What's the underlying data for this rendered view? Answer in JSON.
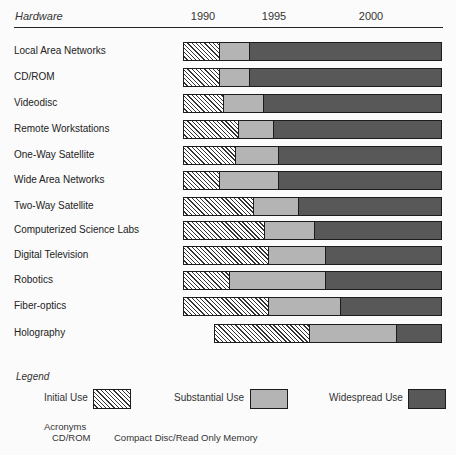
{
  "chart_data": {
    "type": "bar",
    "subtype": "stacked-horizontal-timeline",
    "title": "",
    "xlabel": "",
    "ylabel": "Hardware",
    "x_ticks": [
      "1990",
      "1995",
      "2000"
    ],
    "legend_position": "bottom",
    "grid": false,
    "series_names": [
      "Initial Use",
      "Substantial Use",
      "Widespread Use"
    ],
    "categories": [
      "Local Area Networks",
      "CD/ROM",
      "Videodisc",
      "Remote Workstations",
      "One-Way Satellite",
      "Wide Area Networks",
      "Two-Way Satellite",
      "Computerized Science Labs",
      "Digital Television",
      "Robotics",
      "Fiber-optics",
      "Holography"
    ],
    "rows": [
      {
        "label": "Local Area Networks",
        "px": [
          183,
          219,
          249,
          442
        ],
        "years": {
          "initial_start": 1988.6,
          "substantial_start": 1991.1,
          "widespread_start": 1993.2,
          "end": 2003.6
        }
      },
      {
        "label": "CD/ROM",
        "px": [
          183,
          219,
          249,
          442
        ],
        "years": {
          "initial_start": 1988.6,
          "substantial_start": 1991.1,
          "widespread_start": 1993.2,
          "end": 2003.6
        }
      },
      {
        "label": "Videodisc",
        "px": [
          183,
          223,
          263,
          442
        ],
        "years": {
          "initial_start": 1988.6,
          "substantial_start": 1991.4,
          "widespread_start": 1994.2,
          "end": 2003.6
        }
      },
      {
        "label": "Remote Workstations",
        "px": [
          183,
          238,
          273,
          442
        ],
        "years": {
          "initial_start": 1988.6,
          "substantial_start": 1992.5,
          "widespread_start": 1994.9,
          "end": 2003.6
        }
      },
      {
        "label": "One-Way Satellite",
        "px": [
          183,
          235,
          278,
          442
        ],
        "years": {
          "initial_start": 1988.6,
          "substantial_start": 1992.3,
          "widespread_start": 1995.2,
          "end": 2003.6
        }
      },
      {
        "label": "Wide Area Networks",
        "px": [
          183,
          219,
          278,
          442
        ],
        "years": {
          "initial_start": 1988.6,
          "substantial_start": 1991.1,
          "widespread_start": 1995.2,
          "end": 2003.6
        }
      },
      {
        "label": "Two-Way Satellite",
        "px": [
          183,
          253,
          298,
          442
        ],
        "years": {
          "initial_start": 1988.6,
          "substantial_start": 1993.5,
          "widespread_start": 1996.2,
          "end": 2003.6
        }
      },
      {
        "label": "Computerized Science Labs",
        "px": [
          183,
          264,
          314,
          442
        ],
        "years": {
          "initial_start": 1988.6,
          "substantial_start": 1994.3,
          "widespread_start": 1997.1,
          "end": 2003.6
        }
      },
      {
        "label": "Digital Television",
        "px": [
          183,
          268,
          325,
          442
        ],
        "years": {
          "initial_start": 1988.6,
          "substantial_start": 1994.6,
          "widespread_start": 1997.6,
          "end": 2003.6
        }
      },
      {
        "label": "Robotics",
        "px": [
          183,
          229,
          325,
          442
        ],
        "years": {
          "initial_start": 1988.6,
          "substantial_start": 1991.8,
          "widespread_start": 1997.6,
          "end": 2003.6
        }
      },
      {
        "label": "Fiber-optics",
        "px": [
          183,
          268,
          340,
          442
        ],
        "years": {
          "initial_start": 1988.6,
          "substantial_start": 1994.6,
          "widespread_start": 1998.4,
          "end": 2003.6
        }
      },
      {
        "label": "Holography",
        "px": [
          214,
          309,
          396,
          442
        ],
        "years": {
          "initial_start": 1990.8,
          "substantial_start": 1996.8,
          "widespread_start": 2001.3,
          "end": 2003.6
        }
      }
    ]
  },
  "header": {
    "title": "Hardware",
    "ticks": [
      {
        "label": "1990",
        "x": 203
      },
      {
        "label": "1995",
        "x": 274
      },
      {
        "label": "2000",
        "x": 371
      }
    ]
  },
  "rows": [
    {
      "label": "Local Area Networks",
      "start": 183,
      "b1": 219,
      "b2": 249,
      "end": 442,
      "y": 42
    },
    {
      "label": "CD/ROM",
      "start": 183,
      "b1": 219,
      "b2": 249,
      "end": 442,
      "y": 68
    },
    {
      "label": "Videodisc",
      "start": 183,
      "b1": 223,
      "b2": 263,
      "end": 442,
      "y": 94
    },
    {
      "label": "Remote Workstations",
      "start": 183,
      "b1": 238,
      "b2": 273,
      "end": 442,
      "y": 120
    },
    {
      "label": "One-Way Satellite",
      "start": 183,
      "b1": 235,
      "b2": 278,
      "end": 442,
      "y": 146
    },
    {
      "label": "Wide Area Networks",
      "start": 183,
      "b1": 219,
      "b2": 278,
      "end": 442,
      "y": 171
    },
    {
      "label": "Two-Way Satellite",
      "start": 183,
      "b1": 253,
      "b2": 298,
      "end": 442,
      "y": 197
    },
    {
      "label": "Computerized Science Labs",
      "start": 183,
      "b1": 264,
      "b2": 314,
      "end": 442,
      "y": 221
    },
    {
      "label": "Digital Television",
      "start": 183,
      "b1": 268,
      "b2": 325,
      "end": 442,
      "y": 246
    },
    {
      "label": "Robotics",
      "start": 183,
      "b1": 229,
      "b2": 325,
      "end": 442,
      "y": 271
    },
    {
      "label": "Fiber-optics",
      "start": 183,
      "b1": 268,
      "b2": 340,
      "end": 442,
      "y": 297
    },
    {
      "label": "Holography",
      "start": 214,
      "b1": 309,
      "b2": 396,
      "end": 442,
      "y": 324
    }
  ],
  "legend": {
    "title": "Legend",
    "items": [
      {
        "label": "Initial Use",
        "key": "initial"
      },
      {
        "label": "Substantial Use",
        "key": "substantial"
      },
      {
        "label": "Widespread Use",
        "key": "widespread"
      }
    ]
  },
  "acronyms": {
    "title": "Acronyms",
    "items": [
      {
        "abbr": "CD/ROM",
        "full": "Compact Disc/Read Only Memory"
      }
    ]
  },
  "colors": {
    "initial_hatch": "#333333",
    "substantial": "#b4b4b4",
    "widespread": "#585858",
    "border": "#1c1c1c"
  }
}
